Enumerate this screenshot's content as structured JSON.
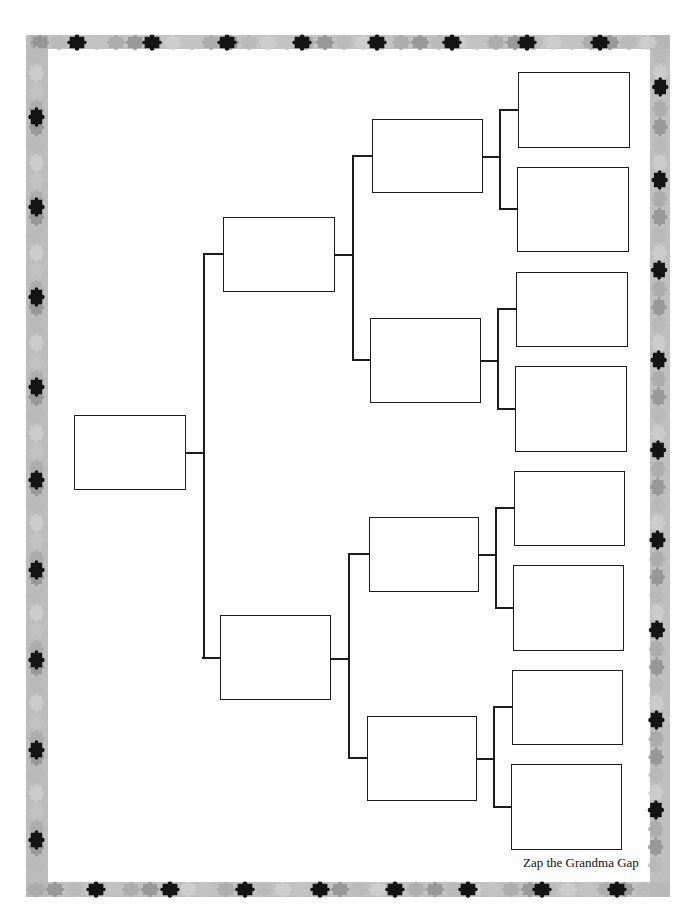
{
  "footer": {
    "text": "Zap the Grandma Gap"
  },
  "colors": {
    "line": "#1c1c1c",
    "border_light": "#c8c8c8",
    "border_mid": "#a9a9a9",
    "border_dark": "#8c8c8c",
    "piece_black": "#141414",
    "background": "#fdfdfd"
  },
  "tree": {
    "generations": 4,
    "boxes": [
      {
        "id": "gen1-self",
        "gen": 1,
        "label": ""
      },
      {
        "id": "gen2-parent-1",
        "gen": 2,
        "label": ""
      },
      {
        "id": "gen2-parent-2",
        "gen": 2,
        "label": ""
      },
      {
        "id": "gen3-grandparent-1",
        "gen": 3,
        "label": ""
      },
      {
        "id": "gen3-grandparent-2",
        "gen": 3,
        "label": ""
      },
      {
        "id": "gen3-grandparent-3",
        "gen": 3,
        "label": ""
      },
      {
        "id": "gen3-grandparent-4",
        "gen": 3,
        "label": ""
      },
      {
        "id": "gen4-great-grandparent-1",
        "gen": 4,
        "label": ""
      },
      {
        "id": "gen4-great-grandparent-2",
        "gen": 4,
        "label": ""
      },
      {
        "id": "gen4-great-grandparent-3",
        "gen": 4,
        "label": ""
      },
      {
        "id": "gen4-great-grandparent-4",
        "gen": 4,
        "label": ""
      },
      {
        "id": "gen4-great-grandparent-5",
        "gen": 4,
        "label": ""
      },
      {
        "id": "gen4-great-grandparent-6",
        "gen": 4,
        "label": ""
      },
      {
        "id": "gen4-great-grandparent-7",
        "gen": 4,
        "label": ""
      },
      {
        "id": "gen4-great-grandparent-8",
        "gen": 4,
        "label": ""
      }
    ]
  },
  "border": {
    "icon": "puzzle-piece-icon",
    "style": "jigsaw puzzle pieces frame"
  }
}
